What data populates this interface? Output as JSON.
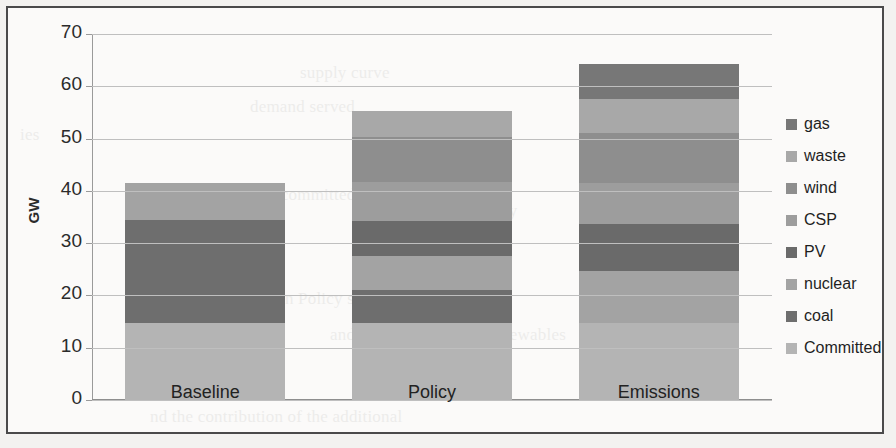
{
  "figure": {
    "y_axis_title": "GW",
    "border_color": "#4a4a4a"
  },
  "bleed_text": [
    {
      "text": "supply curve",
      "x": 300,
      "y": 58
    },
    {
      "text": "demand served",
      "x": 250,
      "y": 92
    },
    {
      "text": "the committed",
      "x": 255,
      "y": 180
    },
    {
      "text": "the new capacity",
      "x": 400,
      "y": 196
    },
    {
      "text": "in Policy scenario",
      "x": 280,
      "y": 284
    },
    {
      "text": "and the penetration of renewables",
      "x": 330,
      "y": 320
    },
    {
      "text": "nd the contribution of the additional",
      "x": 150,
      "y": 402
    },
    {
      "text": "ies",
      "x": 20,
      "y": 120
    }
  ],
  "chart_data": {
    "type": "bar",
    "title": "",
    "subtitle": "",
    "xlabel": "",
    "ylabel": "GW",
    "ylim": [
      0,
      70
    ],
    "y_ticks": [
      0,
      10,
      20,
      30,
      40,
      50,
      60,
      70
    ],
    "grid": true,
    "stacked": true,
    "legend_position": "right",
    "categories": [
      "Baseline",
      "Policy",
      "Emissions"
    ],
    "series": [
      {
        "name": "Committed",
        "color": "#b4b4b4",
        "values": [
          14.8,
          14.8,
          14.8
        ]
      },
      {
        "name": "coal",
        "color": "#6e6e6e",
        "values": [
          19.6,
          6.2,
          0.0
        ]
      },
      {
        "name": "nuclear",
        "color": "#a3a3a3",
        "values": [
          7.1,
          6.6,
          9.9
        ]
      },
      {
        "name": "PV",
        "color": "#6a6a6a",
        "values": [
          0.0,
          6.6,
          9.0
        ]
      },
      {
        "name": "CSP",
        "color": "#9d9d9d",
        "values": [
          0.0,
          7.5,
          7.8
        ]
      },
      {
        "name": "wind",
        "color": "#8e8e8e",
        "values": [
          0.0,
          8.6,
          9.6
        ]
      },
      {
        "name": "waste",
        "color": "#a8a8a8",
        "values": [
          0.0,
          4.9,
          6.4
        ]
      },
      {
        "name": "gas",
        "color": "#777777",
        "values": [
          0.0,
          0.0,
          6.8
        ]
      }
    ],
    "totals": [
      41.5,
      55.2,
      64.3
    ]
  },
  "legend": {
    "items": [
      {
        "label": "gas",
        "color": "#777777"
      },
      {
        "label": "waste",
        "color": "#a8a8a8"
      },
      {
        "label": "wind",
        "color": "#8e8e8e"
      },
      {
        "label": "CSP",
        "color": "#9d9d9d"
      },
      {
        "label": "PV",
        "color": "#6a6a6a"
      },
      {
        "label": "nuclear",
        "color": "#a3a3a3"
      },
      {
        "label": "coal",
        "color": "#6e6e6e"
      },
      {
        "label": "Committed",
        "color": "#b4b4b4"
      }
    ]
  }
}
